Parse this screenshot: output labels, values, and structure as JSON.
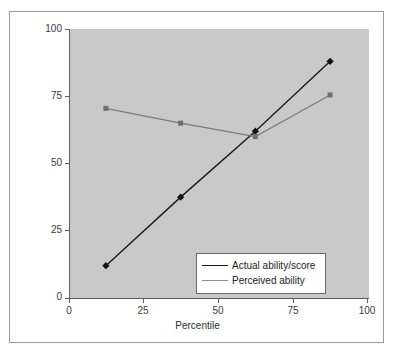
{
  "chart_data": {
    "type": "line",
    "title": "",
    "xlabel": "Percentile",
    "ylabel": "Percentile",
    "xlim": [
      0,
      100
    ],
    "ylim": [
      0,
      100
    ],
    "xticks": [
      "0",
      "25",
      "50",
      "75",
      "100"
    ],
    "yticks": [
      "0",
      "25",
      "50",
      "75",
      "100"
    ],
    "grid": false,
    "legend_position": "inside-lower-right",
    "plot_background": "#c9c9c9",
    "series": [
      {
        "name": "Actual ability/score",
        "color": "#1c1c1c",
        "marker": "diamond",
        "x": [
          12,
          37,
          62,
          87
        ],
        "values": [
          12,
          37.5,
          62,
          88
        ]
      },
      {
        "name": "Perceived ability",
        "color": "#7a7a7a",
        "marker": "square",
        "x": [
          12,
          37,
          62,
          87
        ],
        "values": [
          70.5,
          65,
          60,
          75.5
        ]
      }
    ]
  },
  "axes": {
    "y_title": "Percentile",
    "x_title": "Percentile",
    "y_tick_labels": [
      "100",
      "75",
      "50",
      "25",
      "0"
    ],
    "x_tick_labels": [
      "0",
      "25",
      "50",
      "75",
      "100"
    ]
  },
  "legend": {
    "items": [
      {
        "label": "Actual ability/score",
        "marker": "diamond-marker",
        "color": "#1c1c1c"
      },
      {
        "label": "Perceived ability",
        "marker": "square-marker",
        "color": "#7a7a7a"
      }
    ]
  }
}
